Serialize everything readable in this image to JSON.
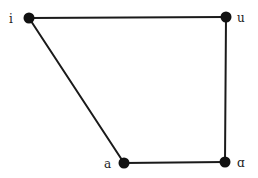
{
  "diagram": {
    "type": "vowel-quadrilateral",
    "nodes": [
      {
        "id": "i",
        "label": "i",
        "x": 29,
        "y": 18,
        "label_x": 9,
        "label_y": 23
      },
      {
        "id": "u",
        "label": "u",
        "x": 226,
        "y": 17,
        "label_x": 237,
        "label_y": 22
      },
      {
        "id": "a",
        "label": "a",
        "x": 124,
        "y": 163,
        "label_x": 104,
        "label_y": 168
      },
      {
        "id": "ɑ",
        "label": "ɑ",
        "x": 225,
        "y": 162,
        "label_x": 237,
        "label_y": 167
      }
    ],
    "edges": [
      {
        "from": "i",
        "to": "u"
      },
      {
        "from": "u",
        "to": "ɑ"
      },
      {
        "from": "ɑ",
        "to": "a"
      },
      {
        "from": "a",
        "to": "i"
      }
    ],
    "colors": {
      "line": "#1a1a1a",
      "node": "#111111",
      "label": "#222222",
      "background": "#ffffff"
    }
  }
}
